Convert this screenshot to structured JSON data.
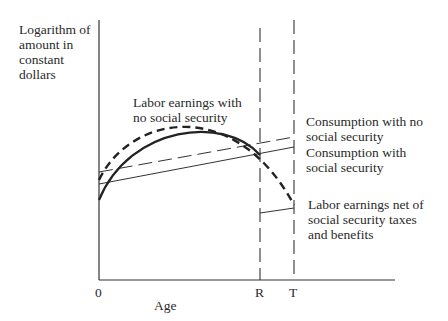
{
  "diagram": {
    "y_axis_label": "Logarithm of\namount in\nconstant\ndollars",
    "x_axis_label": "Age",
    "x_ticks": [
      "0",
      "R",
      "T"
    ],
    "curves": [
      {
        "name": "Labor earnings with no social security",
        "label": "Labor earnings with\nno social security",
        "style": "heavy-dashed"
      },
      {
        "name": "Labor earnings with social security",
        "style": "heavy-solid"
      },
      {
        "name": "Consumption with no social security",
        "label": "Consumption with no\nsocial security",
        "style": "thin-long-dashed"
      },
      {
        "name": "Consumption with social security",
        "label": "Consumption with\nsocial security",
        "style": "thin-solid"
      },
      {
        "name": "Labor earnings net of social security taxes and benefits",
        "label": "Labor earnings net of\nsocial security taxes\nand benefits",
        "style": "thin-solid"
      }
    ],
    "vertical_markers": [
      {
        "label": "R",
        "meaning": "retirement age",
        "style": "dashed"
      },
      {
        "label": "T",
        "meaning": "end of life",
        "style": "dashed"
      }
    ]
  }
}
